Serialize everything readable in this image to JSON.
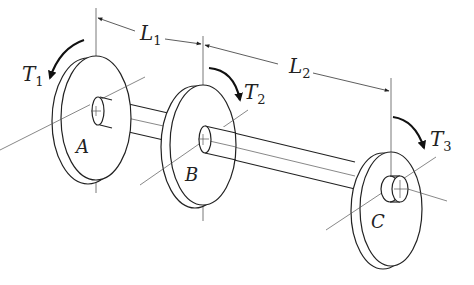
{
  "figure": {
    "colors": {
      "line": "#222222",
      "thin": "#555555",
      "background": "#ffffff"
    }
  },
  "dimensions": [
    {
      "id": "L1",
      "main": "L",
      "sub": "1"
    },
    {
      "id": "L2",
      "main": "L",
      "sub": "2"
    }
  ],
  "torques": [
    {
      "id": "T1",
      "main": "T",
      "sub": "1"
    },
    {
      "id": "T2",
      "main": "T",
      "sub": "2"
    },
    {
      "id": "T3",
      "main": "T",
      "sub": "3"
    }
  ],
  "disks": [
    {
      "id": "A",
      "label": "A"
    },
    {
      "id": "B",
      "label": "B"
    },
    {
      "id": "C",
      "label": "C"
    }
  ]
}
